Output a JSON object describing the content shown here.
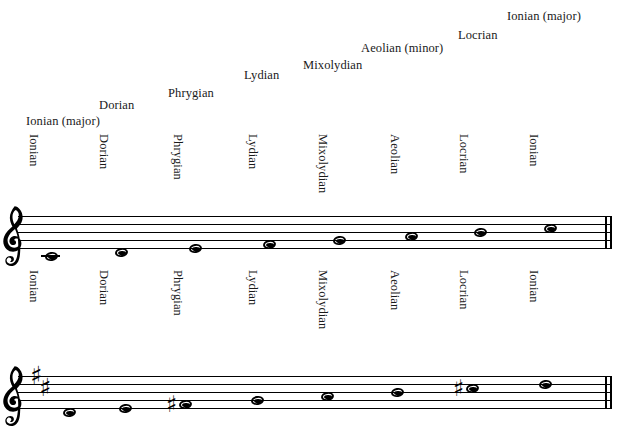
{
  "figure": {
    "title_visible": false
  },
  "diagonal_labels": [
    {
      "text": "Ionian (major)",
      "x": 26,
      "y": 114
    },
    {
      "text": "Dorian",
      "x": 99,
      "y": 98
    },
    {
      "text": "Phrygian",
      "x": 168,
      "y": 86
    },
    {
      "text": "Lydian",
      "x": 244,
      "y": 68
    },
    {
      "text": "Mixolydian",
      "x": 303,
      "y": 58
    },
    {
      "text": "Aeolian (minor)",
      "x": 361,
      "y": 41
    },
    {
      "text": "Locrian",
      "x": 458,
      "y": 28
    },
    {
      "text": "Ionian (major)",
      "x": 507,
      "y": 9
    }
  ],
  "vertical_labels_upper": [
    {
      "text": "Ionian",
      "x": 40,
      "y": 134
    },
    {
      "text": "Dorian",
      "x": 110,
      "y": 134
    },
    {
      "text": "Phrygian",
      "x": 184,
      "y": 134
    },
    {
      "text": "Lydian",
      "x": 259,
      "y": 134
    },
    {
      "text": "Mixolydian",
      "x": 329,
      "y": 134
    },
    {
      "text": "Aeolian",
      "x": 401,
      "y": 134
    },
    {
      "text": "Locrian",
      "x": 470,
      "y": 134
    },
    {
      "text": "Ionian",
      "x": 540,
      "y": 134
    }
  ],
  "vertical_labels_lower": [
    {
      "text": "Ionian",
      "x": 40,
      "y": 270
    },
    {
      "text": "Dorian",
      "x": 110,
      "y": 270
    },
    {
      "text": "Phrygian",
      "x": 184,
      "y": 270
    },
    {
      "text": "Lydian",
      "x": 259,
      "y": 270
    },
    {
      "text": "Mixolydian",
      "x": 329,
      "y": 270
    },
    {
      "text": "Aeolian",
      "x": 401,
      "y": 270
    },
    {
      "text": "Locrian",
      "x": 470,
      "y": 270
    },
    {
      "text": "Ionian",
      "x": 540,
      "y": 270
    }
  ],
  "staves": [
    {
      "name": "upper-staff",
      "clef": "treble-clef",
      "key_signature": {
        "accidental": "sharp",
        "count": 0,
        "sharps": []
      },
      "top": 216,
      "left": 18,
      "right": 612,
      "line_gap": 8,
      "notes": [
        {
          "mode": "Ionian",
          "pitch": "C4",
          "x": 44,
          "staff_pos": -2,
          "accidental": "",
          "ledger": true
        },
        {
          "mode": "Dorian",
          "pitch": "D4",
          "x": 114,
          "staff_pos": -1,
          "accidental": "",
          "ledger": false
        },
        {
          "mode": "Phrygian",
          "pitch": "E4",
          "x": 188,
          "staff_pos": 0,
          "accidental": "",
          "ledger": false
        },
        {
          "mode": "Lydian",
          "pitch": "F4",
          "x": 262,
          "staff_pos": 1,
          "accidental": "",
          "ledger": false
        },
        {
          "mode": "Mixolydian",
          "pitch": "G4",
          "x": 332,
          "staff_pos": 2,
          "accidental": "",
          "ledger": false
        },
        {
          "mode": "Aeolian",
          "pitch": "A4",
          "x": 404,
          "staff_pos": 3,
          "accidental": "",
          "ledger": false
        },
        {
          "mode": "Locrian",
          "pitch": "B4",
          "x": 473,
          "staff_pos": 4,
          "accidental": "",
          "ledger": false
        },
        {
          "mode": "Ionian",
          "pitch": "C5",
          "x": 543,
          "staff_pos": 5,
          "accidental": "",
          "ledger": false
        }
      ]
    },
    {
      "name": "lower-staff",
      "clef": "treble-clef",
      "key_signature": {
        "accidental": "sharp",
        "count": 2,
        "sharps": [
          "F#",
          "C#"
        ]
      },
      "top": 376,
      "left": 18,
      "right": 612,
      "line_gap": 8,
      "notes": [
        {
          "mode": "Ionian",
          "pitch": "D4",
          "x": 62,
          "staff_pos": -1,
          "accidental": "",
          "ledger": false
        },
        {
          "mode": "Dorian",
          "pitch": "E4",
          "x": 118,
          "staff_pos": 0,
          "accidental": "",
          "ledger": false
        },
        {
          "mode": "Phrygian",
          "pitch": "F#4",
          "x": 178,
          "staff_pos": 1,
          "accidental": "sharp",
          "ledger": false
        },
        {
          "mode": "Lydian",
          "pitch": "G4",
          "x": 250,
          "staff_pos": 2,
          "accidental": "",
          "ledger": false
        },
        {
          "mode": "Mixolydian",
          "pitch": "A4",
          "x": 320,
          "staff_pos": 3,
          "accidental": "",
          "ledger": false
        },
        {
          "mode": "Aeolian",
          "pitch": "B4",
          "x": 390,
          "staff_pos": 4,
          "accidental": "",
          "ledger": false
        },
        {
          "mode": "Locrian",
          "pitch": "C#5",
          "x": 465,
          "staff_pos": 5,
          "accidental": "sharp",
          "ledger": false
        },
        {
          "mode": "Ionian",
          "pitch": "D5",
          "x": 538,
          "staff_pos": 6,
          "accidental": "",
          "ledger": false
        }
      ]
    }
  ],
  "glyphs": {
    "sharp": "♯",
    "treble_clef": "𝄞"
  },
  "colors": {
    "ink": "#000000",
    "text": "#1a1a1a",
    "background": "#ffffff"
  }
}
